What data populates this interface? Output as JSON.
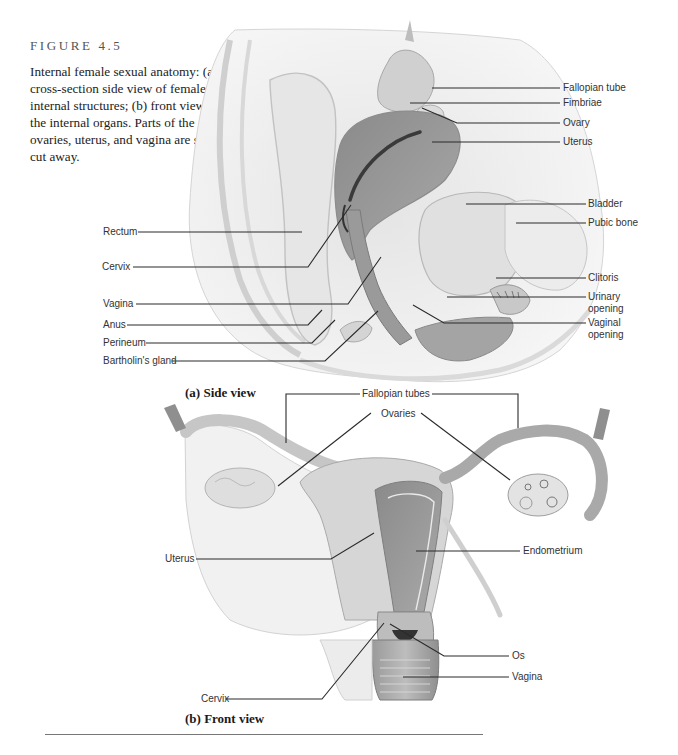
{
  "caption": {
    "figure_number": "FIGURE 4.5",
    "text": "Internal female sexual anatomy: (a) cross-section side view of female internal structures; (b) front view of the internal organs. Parts of the ovaries, uterus, and vagina are shown cut away."
  },
  "side_view": {
    "title": "(a) Side view",
    "labels_right": [
      "Fallopian tube",
      "Fimbriae",
      "Ovary",
      "Uterus",
      "Bladder",
      "Pubic bone",
      "Clitoris",
      "Urinary opening",
      "Vaginal opening"
    ],
    "labels_left": [
      "Rectum",
      "Cervix",
      "Vagina",
      "Anus",
      "Perineum",
      "Bartholin's gland"
    ]
  },
  "front_view": {
    "title": "(b) Front view",
    "labels": {
      "fallopian_tubes": "Fallopian tubes",
      "ovaries": "Ovaries",
      "uterus": "Uterus",
      "endometrium": "Endometrium",
      "os": "Os",
      "vagina": "Vagina",
      "cervix": "Cervix"
    }
  }
}
